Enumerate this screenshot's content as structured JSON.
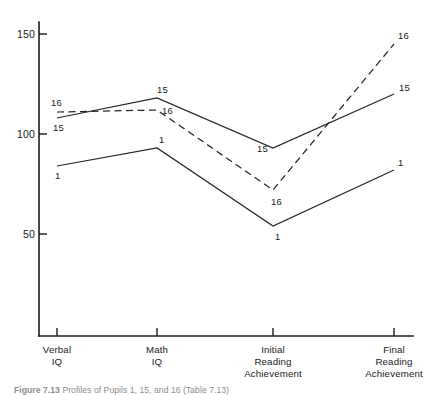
{
  "caption": {
    "prefix": "Figure",
    "number": "7.13",
    "text": "Profiles of Pupils 1, 15, and 16 (Table 7.13)"
  },
  "chart_data": {
    "type": "line",
    "title": "",
    "xlabel": "",
    "ylabel": "",
    "categories": [
      "Verbal IQ",
      "Math IQ",
      "Initial Reading Achievement",
      "Final Reading Achievement"
    ],
    "category_lines": [
      [
        "Verbal",
        "IQ"
      ],
      [
        "Math",
        "IQ"
      ],
      [
        "Initial",
        "Reading",
        "Achievement"
      ],
      [
        "Final",
        "Reading",
        "Achievement"
      ]
    ],
    "ylim": [
      0,
      160
    ],
    "yticks": [
      50,
      100,
      150
    ],
    "ytick_labels": [
      "50",
      "100",
      "150"
    ],
    "grid": false,
    "legend": "none",
    "series": [
      {
        "name": "1",
        "style": "solid",
        "label": "1",
        "values": [
          84,
          93,
          54,
          82
        ],
        "point_labels": [
          "1",
          "1",
          "1",
          "1"
        ]
      },
      {
        "name": "15",
        "style": "solid",
        "label": "15",
        "values": [
          108,
          118,
          93,
          120
        ],
        "point_labels": [
          "15",
          "15",
          "15",
          "15"
        ]
      },
      {
        "name": "16",
        "style": "dashed",
        "label": "16",
        "values": [
          111,
          112,
          72,
          145
        ],
        "point_labels": [
          "16",
          "16",
          "16",
          "16"
        ]
      }
    ]
  }
}
